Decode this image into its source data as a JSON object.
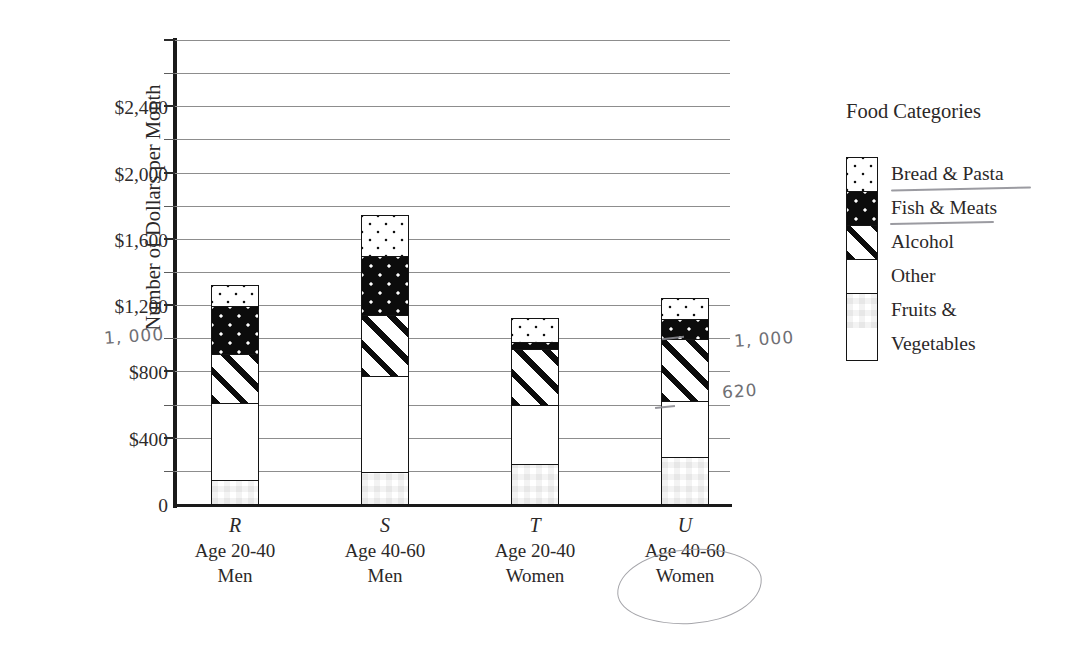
{
  "chart_data": {
    "type": "bar",
    "subtype": "stacked-bar",
    "title": "",
    "xlabel": "",
    "ylabel": "Number of Dollars per Month",
    "ylim": [
      0,
      2800
    ],
    "ytick_step": 400,
    "gridline_step": 200,
    "grid": true,
    "legend_position": "right",
    "legend_title": "Food Categories",
    "categories": [
      "R",
      "S",
      "T",
      "U"
    ],
    "category_sublabels": [
      [
        "Age 20-40",
        "Men"
      ],
      [
        "Age 40-60",
        "Men"
      ],
      [
        "Age 20-40",
        "Women"
      ],
      [
        "Age 40-60",
        "Women"
      ]
    ],
    "ytick_labels": [
      "0",
      "$400",
      "$800",
      "$1,200",
      "$1,600",
      "$2,000",
      "$2,400"
    ],
    "ytick_values": [
      0,
      400,
      800,
      1200,
      1600,
      2000,
      2400
    ],
    "series": [
      {
        "name": "Fruits & Vegetables",
        "pattern": "checkerboard",
        "values": [
          140,
          190,
          240,
          280
        ]
      },
      {
        "name": "Other",
        "pattern": "solid-white",
        "values": [
          470,
          580,
          360,
          340
        ]
      },
      {
        "name": "Alcohol",
        "pattern": "diagonal-stripes",
        "values": [
          300,
          370,
          340,
          380
        ]
      },
      {
        "name": "Fish & Meats",
        "pattern": "black-with-white-dots",
        "values": [
          290,
          360,
          40,
          120
        ]
      },
      {
        "name": "Bread & Pasta",
        "pattern": "white-with-black-dots",
        "values": [
          130,
          250,
          150,
          130
        ]
      }
    ],
    "totals": [
      1330,
      1750,
      1130,
      1250
    ],
    "annotations": [
      {
        "text": "1,000",
        "kind": "handwritten",
        "note": "y-axis value written beside $1,000 gridline"
      },
      {
        "text": "1,000",
        "kind": "handwritten",
        "note": "top of Alcohol segment in bar U"
      },
      {
        "text": "620",
        "kind": "handwritten",
        "note": "bottom of Alcohol segment in bar U"
      },
      {
        "text": "Fish & Meats",
        "kind": "handwritten-underline"
      },
      {
        "text": "Alcohol",
        "kind": "handwritten-underline"
      },
      {
        "text": "U Age 40-60 Women",
        "kind": "handwritten-circle"
      }
    ]
  },
  "axis": {
    "y_title": "Number of Dollars per Month",
    "zero_label": "0"
  },
  "legend": {
    "title": "Food Categories",
    "items": [
      {
        "label": "Bread & Pasta"
      },
      {
        "label": "Fish & Meats"
      },
      {
        "label": "Alcohol"
      },
      {
        "label": "Other"
      },
      {
        "label": "Fruits &"
      },
      {
        "label": "Vegetables"
      }
    ]
  },
  "handwriting": {
    "axis_1000": "1, 000",
    "bar_u_top": "1, 000",
    "bar_u_bottom": "620"
  },
  "colors": {
    "ink": "#231f20",
    "gridline": "#8d8d8d",
    "axis": "#1a1a1a",
    "handwriting": "#6f6f74"
  }
}
